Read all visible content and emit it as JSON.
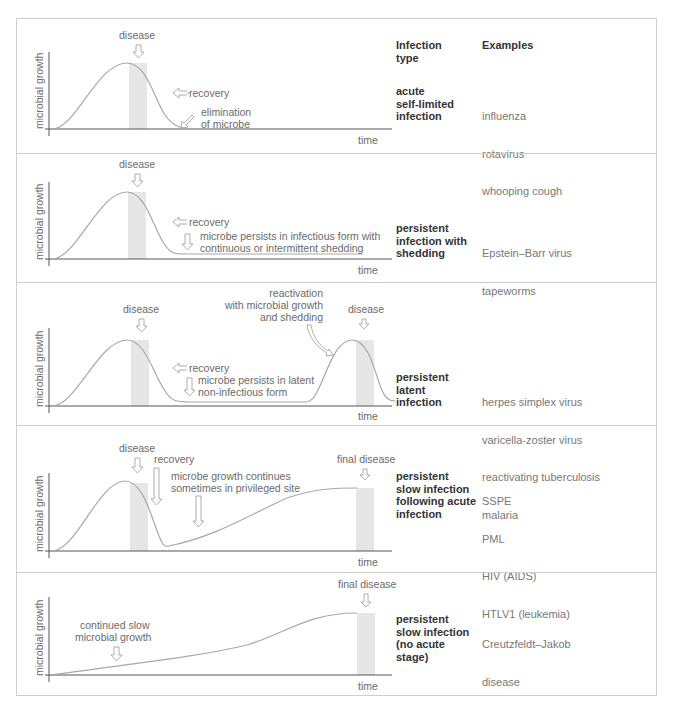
{
  "header": {
    "infection_type": "Infection\ntype",
    "examples": "Examples"
  },
  "axes": {
    "y_label": "microbial growth",
    "x_label": "time"
  },
  "colors": {
    "curve": "#a8a8a8",
    "shade": "#e6e6e6",
    "axis": "#555555",
    "border": "#cfcfcf",
    "arrow": "#9a9a9a"
  },
  "panels": [
    {
      "type_label": "acute\nself-limited\ninfection",
      "examples": [
        "influenza",
        "rotavirus",
        "whooping cough"
      ],
      "annotations": {
        "disease": "disease",
        "recovery": "recovery",
        "elimination_1": "elimination",
        "elimination_2": "of microbe"
      }
    },
    {
      "type_label": "persistent\ninfection with\nshedding",
      "examples": [
        "Epstein–Barr virus",
        "tapeworms"
      ],
      "annotations": {
        "disease": "disease",
        "recovery": "recovery",
        "persist_1": "microbe persists in infectious form with",
        "persist_2": "continuous or intermittent shedding"
      }
    },
    {
      "type_label": "persistent\nlatent\ninfection",
      "examples": [
        "herpes simplex virus",
        "varicella-zoster virus",
        "reactivating tuberculosis",
        "malaria"
      ],
      "annotations": {
        "disease": "disease",
        "recovery": "recovery",
        "latent_1": "microbe persists in latent",
        "latent_2": "non-infectious form",
        "react_1": "reactivation",
        "react_2": "with microbial growth",
        "react_3": "and shedding",
        "disease_2": "disease"
      }
    },
    {
      "type_label": "persistent\nslow infection\nfollowing acute\ninfection",
      "examples": [
        "SSPE",
        "PML",
        "HIV (AIDS)",
        "HTLV1 (leukemia)"
      ],
      "annotations": {
        "disease": "disease",
        "recovery": "recovery",
        "cont_1": "microbe growth continues",
        "cont_2": "sometimes in privileged site",
        "final": "final disease"
      }
    },
    {
      "type_label": "persistent\nslow infection\n(no acute\nstage)",
      "examples": [
        "Creutzfeldt–Jakob",
        "disease"
      ],
      "annotations": {
        "slow_1": "continued slow",
        "slow_2": "microbial growth",
        "final": "final disease"
      }
    }
  ]
}
